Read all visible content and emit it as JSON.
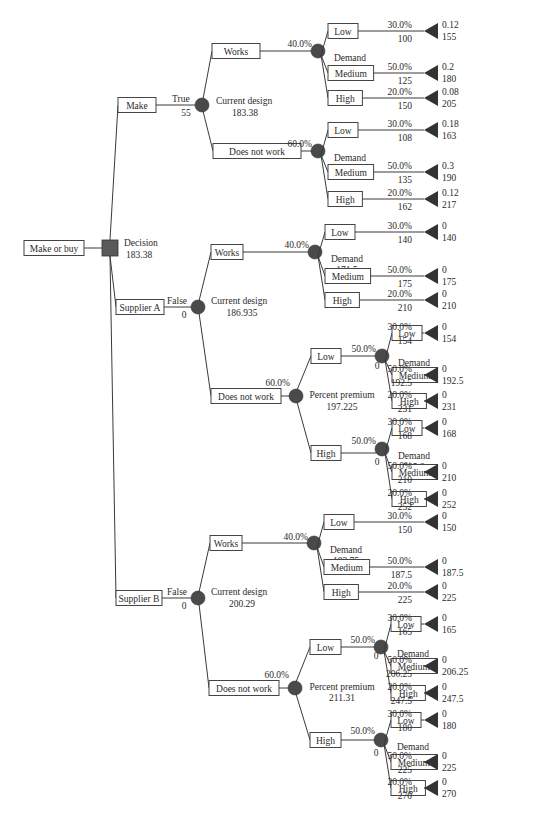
{
  "diagram": {
    "title": "Make or buy",
    "root": {
      "label": "Make or buy",
      "node_type": "decision",
      "node_name": "Decision",
      "node_value": "183.38",
      "branches": [
        {
          "label": "Make",
          "selected": "True",
          "cost": "55",
          "node_name": "Current design",
          "node_value": "183.38",
          "branches": [
            {
              "label": "Works",
              "prob": "40.0%",
              "node_name": "Demand",
              "node_value": "177.5",
              "outcomes": [
                {
                  "label": "Low",
                  "prob": "30.0%",
                  "value": "100",
                  "end_prob": "0.12",
                  "end_value": "155"
                },
                {
                  "label": "Medium",
                  "prob": "50.0%",
                  "value": "125",
                  "end_prob": "0.2",
                  "end_value": "180"
                },
                {
                  "label": "High",
                  "prob": "20.0%",
                  "value": "150",
                  "end_prob": "0.08",
                  "end_value": "205"
                }
              ]
            },
            {
              "label": "Does not work",
              "prob": "60.0%",
              "node_name": "Demand",
              "node_value": "187.3",
              "outcomes": [
                {
                  "label": "Low",
                  "prob": "30.0%",
                  "value": "108",
                  "end_prob": "0.18",
                  "end_value": "163"
                },
                {
                  "label": "Medium",
                  "prob": "50.0%",
                  "value": "135",
                  "end_prob": "0.3",
                  "end_value": "190"
                },
                {
                  "label": "High",
                  "prob": "20.0%",
                  "value": "162",
                  "end_prob": "0.12",
                  "end_value": "217"
                }
              ]
            }
          ]
        },
        {
          "label": "Supplier A",
          "selected": "False",
          "cost": "0",
          "node_name": "Current design",
          "node_value": "186.935",
          "branches": [
            {
              "label": "Works",
              "prob": "40.0%",
              "node_name": "Demand",
              "node_value": "171.5",
              "outcomes": [
                {
                  "label": "Low",
                  "prob": "30.0%",
                  "value": "140",
                  "end_prob": "0",
                  "end_value": "140"
                },
                {
                  "label": "Medium",
                  "prob": "50.0%",
                  "value": "175",
                  "end_prob": "0",
                  "end_value": "175"
                },
                {
                  "label": "High",
                  "prob": "20.0%",
                  "value": "210",
                  "end_prob": "0",
                  "end_value": "210"
                }
              ]
            },
            {
              "label": "Does not work",
              "prob": "60.0%",
              "node_name": "Percent premium",
              "node_value": "197.225",
              "premiums": [
                {
                  "label": "Low",
                  "prob": "50.0%",
                  "cost": "0",
                  "node_name": "Demand",
                  "node_value": "188.65",
                  "outcomes": [
                    {
                      "label": "Low",
                      "prob": "30.0%",
                      "value": "154",
                      "end_prob": "0",
                      "end_value": "154"
                    },
                    {
                      "label": "Medium",
                      "prob": "50.0%",
                      "value": "192.5",
                      "end_prob": "0",
                      "end_value": "192.5"
                    },
                    {
                      "label": "High",
                      "prob": "20.0%",
                      "value": "231",
                      "end_prob": "0",
                      "end_value": "231"
                    }
                  ]
                },
                {
                  "label": "High",
                  "prob": "50.0%",
                  "cost": "0",
                  "node_name": "Demand",
                  "node_value": "205.8",
                  "outcomes": [
                    {
                      "label": "Low",
                      "prob": "30.0%",
                      "value": "168",
                      "end_prob": "0",
                      "end_value": "168"
                    },
                    {
                      "label": "Medium",
                      "prob": "50.0%",
                      "value": "210",
                      "end_prob": "0",
                      "end_value": "210"
                    },
                    {
                      "label": "High",
                      "prob": "20.0%",
                      "value": "252",
                      "end_prob": "0",
                      "end_value": "252"
                    }
                  ]
                }
              ]
            }
          ]
        },
        {
          "label": "Supplier B",
          "selected": "False",
          "cost": "0",
          "node_name": "Current design",
          "node_value": "200.29",
          "branches": [
            {
              "label": "Works",
              "prob": "40.0%",
              "node_name": "Demand",
              "node_value": "183.75",
              "outcomes": [
                {
                  "label": "Low",
                  "prob": "30.0%",
                  "value": "150",
                  "end_prob": "0",
                  "end_value": "150"
                },
                {
                  "label": "Medium",
                  "prob": "50.0%",
                  "value": "187.5",
                  "end_prob": "0",
                  "end_value": "187.5"
                },
                {
                  "label": "High",
                  "prob": "20.0%",
                  "value": "225",
                  "end_prob": "0",
                  "end_value": "225"
                }
              ]
            },
            {
              "label": "Does not work",
              "prob": "60.0%",
              "node_name": "Percent premium",
              "node_value": "211.31",
              "premiums": [
                {
                  "label": "Low",
                  "prob": "50.0%",
                  "cost": "0",
                  "node_name": "Demand",
                  "node_value": "202.13",
                  "outcomes": [
                    {
                      "label": "Low",
                      "prob": "30.0%",
                      "value": "165",
                      "end_prob": "0",
                      "end_value": "165"
                    },
                    {
                      "label": "Medium",
                      "prob": "50.0%",
                      "value": "206.25",
                      "end_prob": "0",
                      "end_value": "206.25"
                    },
                    {
                      "label": "High",
                      "prob": "20.0%",
                      "value": "247.5",
                      "end_prob": "0",
                      "end_value": "247.5"
                    }
                  ]
                },
                {
                  "label": "High",
                  "prob": "50.0%",
                  "cost": "0",
                  "node_name": "Demand",
                  "node_value": "220.5",
                  "outcomes": [
                    {
                      "label": "Low",
                      "prob": "30.0%",
                      "value": "180",
                      "end_prob": "0",
                      "end_value": "180"
                    },
                    {
                      "label": "Medium",
                      "prob": "50.0%",
                      "value": "225",
                      "end_prob": "0",
                      "end_value": "225"
                    },
                    {
                      "label": "High",
                      "prob": "20.0%",
                      "value": "270",
                      "end_prob": "0",
                      "end_value": "270"
                    }
                  ]
                }
              ]
            }
          ]
        }
      ]
    }
  }
}
